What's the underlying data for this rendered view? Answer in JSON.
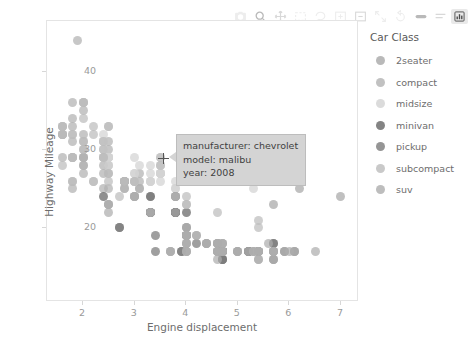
{
  "modebar": {
    "buttons": [
      {
        "name": "camera-icon",
        "label": "Download plot as a png",
        "state": "faint"
      },
      {
        "name": "zoom-icon",
        "label": "Zoom",
        "state": "strong"
      },
      {
        "name": "pan-icon",
        "label": "Pan",
        "state": "mid"
      },
      {
        "name": "box-select-icon",
        "label": "Box Select",
        "state": "faint"
      },
      {
        "name": "lasso-select-icon",
        "label": "Lasso Select",
        "state": "faint"
      },
      {
        "name": "zoom-in-icon",
        "label": "Zoom in",
        "state": "faint"
      },
      {
        "name": "zoom-out-icon",
        "label": "Zoom out",
        "state": "mid"
      },
      {
        "name": "autoscale-icon",
        "label": "Autoscale",
        "state": "faint"
      },
      {
        "name": "reset-axes-icon",
        "label": "Reset axes",
        "state": "faint"
      },
      {
        "name": "toggle-spike-lines-icon",
        "label": "Toggle Spike Lines",
        "state": "strong"
      },
      {
        "name": "hover-compare-icon",
        "label": "Compare data on hover",
        "state": "mid"
      },
      {
        "name": "plotly-logo-icon",
        "label": "Produced with Plotly",
        "state": "active"
      }
    ]
  },
  "chart_data": {
    "type": "scatter",
    "title": "",
    "xlabel": "Engine displacement",
    "ylabel": "Highway Mileage",
    "xlim": [
      1.3,
      7.35
    ],
    "ylim": [
      10.5,
      46.5
    ],
    "xticks": [
      "2",
      "3",
      "4",
      "5",
      "6",
      "7"
    ],
    "xtick_values": [
      2,
      3,
      4,
      5,
      6,
      7
    ],
    "yticks": [
      "20",
      "30",
      "40"
    ],
    "ytick_values": [
      20,
      30,
      40
    ],
    "grid": false,
    "legend": {
      "title": "Car Class",
      "position": "right",
      "entries": [
        {
          "label": "2seater",
          "color": "#a8a8a8"
        },
        {
          "label": "compact",
          "color": "#b2b2b2"
        },
        {
          "label": "midsize",
          "color": "#d2d2d2"
        },
        {
          "label": "minivan",
          "color": "#656565"
        },
        {
          "label": "pickup",
          "color": "#7a7a7a"
        },
        {
          "label": "subcompact",
          "color": "#bcbcbc"
        },
        {
          "label": "suv",
          "color": "#adadad"
        }
      ]
    },
    "series": [
      {
        "name": "2seater",
        "color": "#a8a8a8",
        "points": [
          [
            5.7,
            26
          ],
          [
            5.7,
            23
          ],
          [
            6.2,
            26
          ],
          [
            6.2,
            25
          ],
          [
            7.0,
            24
          ]
        ]
      },
      {
        "name": "compact",
        "color": "#b2b2b2",
        "points": [
          [
            1.8,
            29
          ],
          [
            1.8,
            29
          ],
          [
            2.0,
            31
          ],
          [
            2.0,
            30
          ],
          [
            2.8,
            26
          ],
          [
            2.8,
            26
          ],
          [
            3.1,
            27
          ],
          [
            1.8,
            26
          ],
          [
            1.8,
            25
          ],
          [
            2.0,
            28
          ],
          [
            2.0,
            27
          ],
          [
            2.8,
            25
          ],
          [
            2.8,
            25
          ],
          [
            3.1,
            25
          ],
          [
            3.1,
            25
          ],
          [
            2.4,
            27
          ],
          [
            2.4,
            25
          ],
          [
            2.5,
            27
          ],
          [
            2.5,
            25
          ],
          [
            3.3,
            24
          ],
          [
            2.0,
            28
          ],
          [
            2.0,
            29
          ],
          [
            2.8,
            26
          ],
          [
            2.8,
            26
          ],
          [
            3.1,
            26
          ],
          [
            1.6,
            33
          ],
          [
            1.6,
            32
          ],
          [
            1.6,
            32
          ],
          [
            1.6,
            29
          ],
          [
            1.6,
            32
          ],
          [
            1.8,
            34
          ],
          [
            1.8,
            36
          ],
          [
            2.0,
            36
          ],
          [
            2.4,
            31
          ],
          [
            2.4,
            28
          ],
          [
            2.5,
            31
          ],
          [
            2.5,
            30
          ],
          [
            1.8,
            31
          ],
          [
            1.8,
            33
          ],
          [
            2.0,
            32
          ],
          [
            2.0,
            35
          ],
          [
            2.8,
            26
          ],
          [
            1.9,
            44
          ],
          [
            2.0,
            29
          ],
          [
            2.0,
            29
          ],
          [
            2.5,
            28
          ],
          [
            2.5,
            29
          ]
        ]
      },
      {
        "name": "midsize",
        "color": "#d2d2d2",
        "points": [
          [
            2.4,
            29
          ],
          [
            2.4,
            29
          ],
          [
            3.1,
            28
          ],
          [
            3.5,
            29
          ],
          [
            2.4,
            31
          ],
          [
            2.4,
            30
          ],
          [
            3.0,
            26
          ],
          [
            3.3,
            26
          ],
          [
            2.4,
            32
          ],
          [
            2.4,
            30
          ],
          [
            3.0,
            29
          ],
          [
            3.3,
            28
          ],
          [
            2.5,
            29
          ],
          [
            2.5,
            29
          ],
          [
            3.0,
            27
          ],
          [
            3.0,
            26
          ],
          [
            3.5,
            27
          ],
          [
            3.5,
            27
          ],
          [
            3.5,
            26
          ],
          [
            3.8,
            25
          ],
          [
            3.8,
            25
          ],
          [
            5.3,
            25
          ],
          [
            2.4,
            31
          ],
          [
            2.4,
            29
          ],
          [
            3.0,
            27
          ],
          [
            3.3,
            27
          ],
          [
            3.3,
            26
          ],
          [
            3.3,
            26
          ],
          [
            3.8,
            26
          ],
          [
            3.8,
            24
          ],
          [
            3.8,
            24
          ],
          [
            4.0,
            26
          ],
          [
            2.5,
            28
          ],
          [
            2.5,
            29
          ],
          [
            2.5,
            29
          ],
          [
            3.5,
            28
          ],
          [
            3.5,
            27
          ],
          [
            3.5,
            28
          ],
          [
            3.5,
            27
          ],
          [
            3.5,
            27
          ]
        ]
      },
      {
        "name": "minivan",
        "color": "#656565",
        "points": [
          [
            2.4,
            24
          ],
          [
            3.0,
            24
          ],
          [
            3.3,
            22
          ],
          [
            3.3,
            22
          ],
          [
            3.8,
            22
          ],
          [
            3.8,
            22
          ],
          [
            3.3,
            22
          ],
          [
            3.8,
            22
          ],
          [
            3.8,
            22
          ],
          [
            4.0,
            22
          ],
          [
            3.3,
            24
          ],
          [
            3.8,
            24
          ]
        ]
      },
      {
        "name": "pickup",
        "color": "#7a7a7a",
        "points": [
          [
            2.7,
            20
          ],
          [
            2.7,
            20
          ],
          [
            3.4,
            19
          ],
          [
            3.4,
            17
          ],
          [
            4.0,
            20
          ],
          [
            4.7,
            17
          ],
          [
            4.7,
            17
          ],
          [
            4.7,
            17
          ],
          [
            4.7,
            17
          ],
          [
            5.2,
            17
          ],
          [
            5.2,
            17
          ],
          [
            3.9,
            17
          ],
          [
            3.9,
            17
          ],
          [
            4.7,
            17
          ],
          [
            4.7,
            17
          ],
          [
            4.7,
            17
          ],
          [
            5.2,
            17
          ],
          [
            5.7,
            17
          ],
          [
            5.9,
            17
          ],
          [
            4.7,
            17
          ],
          [
            4.7,
            16
          ],
          [
            4.7,
            16
          ],
          [
            4.7,
            16
          ],
          [
            5.7,
            16
          ],
          [
            5.7,
            18
          ],
          [
            5.7,
            18
          ],
          [
            6.1,
            17
          ],
          [
            4.0,
            19
          ],
          [
            4.2,
            18
          ],
          [
            4.4,
            18
          ],
          [
            4.6,
            17
          ],
          [
            5.4,
            17
          ],
          [
            5.4,
            17
          ],
          [
            4.0,
            19
          ],
          [
            4.0,
            19
          ],
          [
            4.6,
            18
          ],
          [
            5.0,
            17
          ]
        ]
      },
      {
        "name": "subcompact",
        "color": "#bcbcbc",
        "points": [
          [
            1.8,
            29
          ],
          [
            1.8,
            29
          ],
          [
            2.0,
            31
          ],
          [
            2.0,
            30
          ],
          [
            2.8,
            26
          ],
          [
            1.6,
            33
          ],
          [
            1.6,
            33
          ],
          [
            1.6,
            32
          ],
          [
            1.8,
            32
          ],
          [
            1.8,
            32
          ],
          [
            2.0,
            34
          ],
          [
            2.4,
            31
          ],
          [
            2.4,
            30
          ],
          [
            2.5,
            33
          ],
          [
            2.5,
            33
          ],
          [
            2.0,
            36
          ],
          [
            2.0,
            36
          ],
          [
            2.2,
            33
          ],
          [
            2.2,
            32
          ],
          [
            2.4,
            29
          ],
          [
            2.4,
            29
          ],
          [
            3.5,
            29
          ],
          [
            3.5,
            28
          ],
          [
            3.8,
            24
          ],
          [
            4.0,
            24
          ],
          [
            4.6,
            22
          ],
          [
            5.4,
            20
          ],
          [
            5.4,
            21
          ],
          [
            2.5,
            26
          ],
          [
            2.5,
            27
          ],
          [
            2.2,
            26
          ],
          [
            2.2,
            26
          ],
          [
            3.0,
            26
          ],
          [
            3.0,
            26
          ],
          [
            4.0,
            23
          ],
          [
            4.0,
            23
          ],
          [
            1.6,
            28
          ],
          [
            1.8,
            26
          ],
          [
            2.7,
            24
          ],
          [
            3.0,
            24
          ]
        ]
      },
      {
        "name": "suv",
        "color": "#adadad",
        "points": [
          [
            4.0,
            19
          ],
          [
            4.0,
            18
          ],
          [
            4.6,
            18
          ],
          [
            4.6,
            17
          ],
          [
            4.6,
            18
          ],
          [
            5.4,
            17
          ],
          [
            5.4,
            17
          ],
          [
            3.0,
            24
          ],
          [
            3.3,
            22
          ],
          [
            4.0,
            19
          ],
          [
            4.0,
            19
          ],
          [
            4.7,
            17
          ],
          [
            4.7,
            17
          ],
          [
            4.7,
            17
          ],
          [
            5.2,
            17
          ],
          [
            5.7,
            17
          ],
          [
            5.9,
            17
          ],
          [
            4.0,
            20
          ],
          [
            4.2,
            19
          ],
          [
            4.4,
            18
          ],
          [
            4.6,
            17
          ],
          [
            5.4,
            17
          ],
          [
            5.4,
            17
          ],
          [
            3.3,
            22
          ],
          [
            3.8,
            22
          ],
          [
            4.0,
            19
          ],
          [
            4.0,
            19
          ],
          [
            4.6,
            17
          ],
          [
            5.0,
            17
          ],
          [
            5.3,
            17
          ],
          [
            5.3,
            17
          ],
          [
            5.3,
            17
          ],
          [
            5.7,
            17
          ],
          [
            6.0,
            17
          ],
          [
            5.6,
            18
          ],
          [
            3.7,
            17
          ],
          [
            3.7,
            17
          ],
          [
            4.0,
            17
          ],
          [
            4.0,
            17
          ],
          [
            4.7,
            18
          ],
          [
            4.7,
            18
          ],
          [
            5.7,
            17
          ],
          [
            6.1,
            17
          ],
          [
            4.0,
            19
          ],
          [
            4.0,
            19
          ],
          [
            4.6,
            18
          ],
          [
            5.0,
            17
          ],
          [
            4.2,
            19
          ],
          [
            4.4,
            18
          ],
          [
            4.6,
            17
          ],
          [
            4.6,
            16
          ],
          [
            5.4,
            16
          ],
          [
            5.4,
            16
          ],
          [
            4.0,
            18
          ],
          [
            4.0,
            18
          ],
          [
            4.7,
            18
          ],
          [
            4.7,
            17
          ],
          [
            4.7,
            17
          ],
          [
            5.7,
            16
          ],
          [
            6.5,
            17
          ],
          [
            2.5,
            23
          ],
          [
            2.5,
            23
          ],
          [
            2.5,
            22
          ],
          [
            2.5,
            23
          ],
          [
            3.7,
            17
          ],
          [
            4.0,
            17
          ]
        ]
      }
    ]
  },
  "tooltip": {
    "lines": [
      "manufacturer: chevrolet",
      "model: malibu",
      "year: 2008"
    ]
  }
}
